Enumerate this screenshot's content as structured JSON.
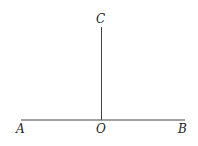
{
  "diagram": {
    "labels": {
      "A": "A",
      "B": "B",
      "C": "C",
      "O": "O"
    },
    "line_color": "#444444"
  }
}
